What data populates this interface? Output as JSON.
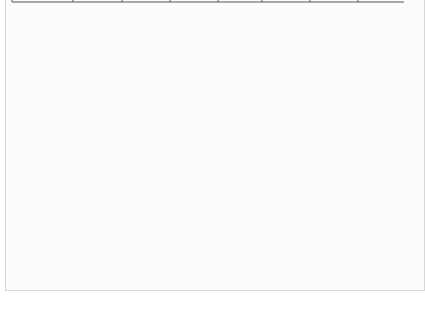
{
  "chart_data": {
    "type": "line",
    "title": "",
    "xlabel": "x",
    "ylabel": "y",
    "origin_label": "O",
    "xlim": [
      0,
      9.5
    ],
    "ylim": [
      -7,
      7
    ],
    "x_unit": "a",
    "y_unit": "a",
    "grid": true,
    "x_ticks": [
      {
        "value": 2,
        "label": "2a"
      },
      {
        "value": 4,
        "label": "4a"
      },
      {
        "value": 6,
        "label": "6a"
      },
      {
        "value": 8,
        "label": "8a"
      }
    ],
    "y_ticks": [
      {
        "value": 6,
        "label": "6a"
      },
      {
        "value": 4,
        "label": "4a"
      },
      {
        "value": 2,
        "label": "2a"
      },
      {
        "value": -2,
        "label": "-2a"
      },
      {
        "value": -4,
        "label": "-4a"
      },
      {
        "value": -6,
        "label": "-6a"
      }
    ],
    "series": [
      {
        "name": "parabola y^2 = 4ax",
        "curve": "y^2 = 4ax",
        "marked_points": [
          {
            "x": 0,
            "y": 0
          },
          {
            "x": 1,
            "y": 2
          },
          {
            "x": 4,
            "y": 4
          },
          {
            "x": 9,
            "y": 6
          },
          {
            "x": 1,
            "y": -2
          },
          {
            "x": 4,
            "y": -4
          },
          {
            "x": 9,
            "y": -6
          }
        ]
      }
    ],
    "annotations": [
      {
        "type": "leader-line",
        "from": {
          "x": 4.6,
          "y": -4.5
        },
        "direction": "down",
        "label": ""
      }
    ]
  },
  "colors": {
    "grid": "#c8c8c8",
    "axis": "#222222",
    "curve": "#1a1a1a",
    "frame": "#d8d8d8"
  }
}
